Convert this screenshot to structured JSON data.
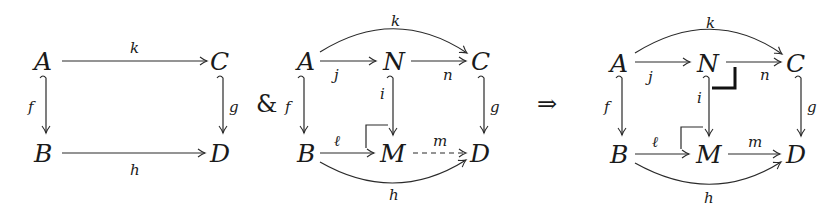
{
  "diagram": {
    "connectives": {
      "and": "&",
      "implies": "⇒"
    },
    "left_square": {
      "objects": {
        "A": "A",
        "B": "B",
        "C": "C",
        "D": "D"
      },
      "arrows": [
        {
          "from": "A",
          "to": "C",
          "label": "k",
          "style": "solid"
        },
        {
          "from": "A",
          "to": "B",
          "label": "f",
          "style": "hook"
        },
        {
          "from": "C",
          "to": "D",
          "label": "g",
          "style": "hook"
        },
        {
          "from": "B",
          "to": "D",
          "label": "h",
          "style": "solid"
        }
      ]
    },
    "middle_diagram": {
      "objects": {
        "A": "A",
        "N": "N",
        "C": "C",
        "B": "B",
        "M": "M",
        "D": "D"
      },
      "arrows": [
        {
          "from": "A",
          "to": "C",
          "label": "k",
          "style": "curved"
        },
        {
          "from": "A",
          "to": "N",
          "label": "j",
          "style": "solid"
        },
        {
          "from": "N",
          "to": "C",
          "label": "n",
          "style": "solid"
        },
        {
          "from": "A",
          "to": "B",
          "label": "f",
          "style": "hook"
        },
        {
          "from": "N",
          "to": "M",
          "label": "i",
          "style": "hook"
        },
        {
          "from": "C",
          "to": "D",
          "label": "g",
          "style": "hook"
        },
        {
          "from": "B",
          "to": "M",
          "label": "ℓ",
          "style": "solid"
        },
        {
          "from": "M",
          "to": "D",
          "label": "m",
          "style": "dashed"
        },
        {
          "from": "B",
          "to": "D",
          "label": "h",
          "style": "curved"
        }
      ],
      "corner_marks": [
        "pushout at M"
      ]
    },
    "right_diagram": {
      "objects": {
        "A": "A",
        "N": "N",
        "C": "C",
        "B": "B",
        "M": "M",
        "D": "D"
      },
      "arrows": [
        {
          "from": "A",
          "to": "C",
          "label": "k",
          "style": "curved"
        },
        {
          "from": "A",
          "to": "N",
          "label": "j",
          "style": "solid"
        },
        {
          "from": "N",
          "to": "C",
          "label": "n",
          "style": "solid"
        },
        {
          "from": "A",
          "to": "B",
          "label": "f",
          "style": "hook"
        },
        {
          "from": "N",
          "to": "M",
          "label": "i",
          "style": "hook"
        },
        {
          "from": "C",
          "to": "D",
          "label": "g",
          "style": "hook"
        },
        {
          "from": "B",
          "to": "M",
          "label": "ℓ",
          "style": "solid"
        },
        {
          "from": "M",
          "to": "D",
          "label": "m",
          "style": "solid"
        },
        {
          "from": "B",
          "to": "D",
          "label": "h",
          "style": "curved"
        }
      ],
      "corner_marks": [
        "pushout at M",
        "pullback (bold) at N"
      ]
    }
  }
}
